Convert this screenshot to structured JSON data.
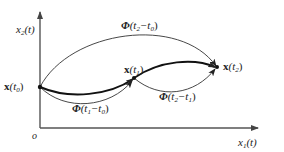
{
  "axes": {
    "y_label": {
      "var": "x",
      "sub": "2",
      "arg": "(t)"
    },
    "x_label": {
      "var": "x",
      "sub": "1",
      "arg": "(t)"
    },
    "origin": "o"
  },
  "points": [
    {
      "id": "t0",
      "var": "x",
      "open": "(t",
      "sub": "0",
      "close": ")"
    },
    {
      "id": "t1",
      "var": "x",
      "open": "(t",
      "sub": "1",
      "close": ")"
    },
    {
      "id": "t2",
      "var": "x",
      "open": "(t",
      "sub": "2",
      "close": ")"
    }
  ],
  "transitions": [
    {
      "id": "phi_t2_t0",
      "sym": "Φ",
      "open": "(t",
      "a": "2",
      "mid": "−t",
      "b": "0",
      "close": ")"
    },
    {
      "id": "phi_t1_t0",
      "sym": "Φ",
      "open": "(t",
      "a": "1",
      "mid": "−t",
      "b": "0",
      "close": ")"
    },
    {
      "id": "phi_t2_t1",
      "sym": "Φ",
      "open": "(t",
      "a": "2",
      "mid": "−t",
      "b": "1",
      "close": ")"
    }
  ],
  "colors": {
    "line": "#333333",
    "axis": "#555555",
    "text": "#222222"
  }
}
